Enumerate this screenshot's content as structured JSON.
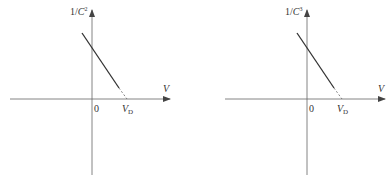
{
  "figures": [
    {
      "id": "left",
      "y_axis_label": {
        "prefix": "1/",
        "var": "C",
        "sup": "2"
      },
      "x_axis_label": "V",
      "origin_label": "0",
      "intercept_label": {
        "var": "V",
        "sub": "D"
      }
    },
    {
      "id": "right",
      "y_axis_label": {
        "prefix": "1/",
        "var": "C",
        "sup": "3"
      },
      "x_axis_label": "V",
      "origin_label": "0",
      "intercept_label": {
        "var": "V",
        "sub": "D"
      }
    }
  ],
  "colors": {
    "axis": "#555555",
    "line": "#333333",
    "text": "#333333"
  }
}
